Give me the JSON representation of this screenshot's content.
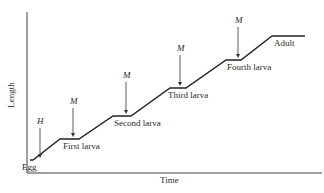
{
  "diagram": {
    "axes": {
      "x_label": "Time",
      "y_label": "Length"
    },
    "stages": [
      {
        "label": "Egg",
        "x": 22,
        "y": 162
      },
      {
        "label": "First larva",
        "x": 63,
        "y": 141
      },
      {
        "label": "Second larva",
        "x": 114,
        "y": 118
      },
      {
        "label": "Third larva",
        "x": 168,
        "y": 90
      },
      {
        "label": "Fourth larva",
        "x": 227,
        "y": 62
      },
      {
        "label": "Adult",
        "x": 274,
        "y": 38
      }
    ],
    "arrows": [
      {
        "label": "H",
        "x": 40,
        "y1": 128,
        "y2": 158
      },
      {
        "label": "M",
        "x": 73,
        "y1": 108,
        "y2": 137
      },
      {
        "label": "M",
        "x": 126,
        "y1": 82,
        "y2": 114
      },
      {
        "label": "M",
        "x": 180,
        "y1": 55,
        "y2": 86
      },
      {
        "label": "M",
        "x": 238,
        "y1": 27,
        "y2": 58
      }
    ],
    "growth_path": "30,160 33,160 60,139 79,139 113,116 131,116 170,88 186,88 226,60 241,60 272,36 305,36"
  }
}
